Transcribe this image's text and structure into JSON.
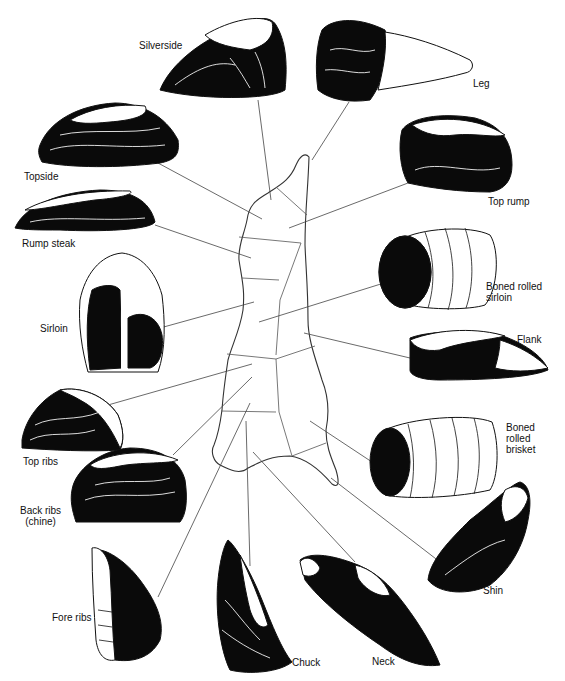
{
  "diagram": {
    "cuts": [
      {
        "id": "silverside",
        "label": "Silverside"
      },
      {
        "id": "leg",
        "label": "Leg"
      },
      {
        "id": "topside",
        "label": "Topside"
      },
      {
        "id": "top-rump",
        "label": "Top rump"
      },
      {
        "id": "rump-steak",
        "label": "Rump steak"
      },
      {
        "id": "boned-rolled-sirloin",
        "label": "Boned rolled\nsirloin"
      },
      {
        "id": "sirloin",
        "label": "Sirloin"
      },
      {
        "id": "flank",
        "label": "Flank"
      },
      {
        "id": "top-ribs",
        "label": "Top ribs"
      },
      {
        "id": "boned-rolled-brisket",
        "label": "Boned\nrolled\nbrisket"
      },
      {
        "id": "back-ribs",
        "label": "Back ribs\n(chine)"
      },
      {
        "id": "shin",
        "label": "Shin"
      },
      {
        "id": "fore-ribs",
        "label": "Fore ribs"
      },
      {
        "id": "chuck",
        "label": "Chuck"
      },
      {
        "id": "neck",
        "label": "Neck"
      }
    ]
  }
}
